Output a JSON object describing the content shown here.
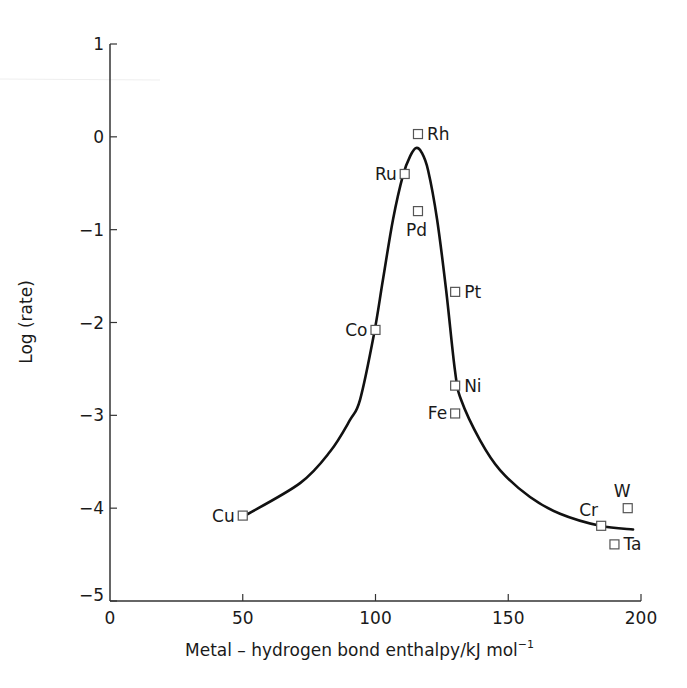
{
  "chart_data": {
    "type": "scatter",
    "title": "",
    "xlabel": "Metal – hydrogen bond enthalpy/kJ mol",
    "xlabel_superscript": "−1",
    "ylabel": "Log (rate)",
    "xlim": [
      0,
      200
    ],
    "ylim": [
      -5,
      1
    ],
    "xticks": [
      0,
      50,
      100,
      150,
      200
    ],
    "xtick_labels": [
      "0",
      "50",
      "100",
      "150",
      "200"
    ],
    "yticks": [
      1,
      0,
      -1,
      -2,
      -3,
      -4,
      -5
    ],
    "ytick_labels": [
      "1",
      "0",
      "−1",
      "−2",
      "−3",
      "−4",
      "−5"
    ],
    "grid": false,
    "legend": null,
    "points": [
      {
        "label": "Rh",
        "x": 116,
        "y": 0.03,
        "label_pos": "right"
      },
      {
        "label": "Ru",
        "x": 111,
        "y": -0.4,
        "label_pos": "left"
      },
      {
        "label": "Pd",
        "x": 116,
        "y": -0.8,
        "label_pos": "below"
      },
      {
        "label": "Pt",
        "x": 130,
        "y": -1.67,
        "label_pos": "right"
      },
      {
        "label": "Co",
        "x": 100,
        "y": -2.08,
        "label_pos": "left"
      },
      {
        "label": "Ni",
        "x": 130,
        "y": -2.68,
        "label_pos": "right"
      },
      {
        "label": "Fe",
        "x": 130,
        "y": -2.98,
        "label_pos": "left"
      },
      {
        "label": "Cu",
        "x": 50,
        "y": -4.08,
        "label_pos": "left"
      },
      {
        "label": "Cr",
        "x": 185,
        "y": -4.19,
        "label_pos": "above-left"
      },
      {
        "label": "W",
        "x": 195,
        "y": -4.0,
        "label_pos": "above"
      },
      {
        "label": "Ta",
        "x": 190,
        "y": -4.39,
        "label_pos": "right"
      }
    ],
    "curve": {
      "name": "volcano fit",
      "x": [
        50.8,
        71.6,
        82.9,
        90.4,
        94.2,
        99.4,
        102.8,
        106.6,
        110.4,
        113.2,
        115.3,
        117.4,
        119.8,
        123.2,
        126.6,
        129.9,
        132.2,
        139.4,
        146.9,
        158.2,
        169.5,
        184.6,
        197
      ],
      "y": [
        -4.08,
        -3.73,
        -3.39,
        -3.05,
        -2.83,
        -2.13,
        -1.54,
        -0.89,
        -0.41,
        -0.2,
        -0.12,
        -0.17,
        -0.36,
        -0.89,
        -1.65,
        -2.51,
        -2.83,
        -3.27,
        -3.59,
        -3.88,
        -4.06,
        -4.19,
        -4.23
      ]
    }
  },
  "colors": {
    "axis": "#333333",
    "curve": "#111111",
    "marker_stroke": "#555555",
    "marker_fill": "#ffffff",
    "text": "#1a1a1a"
  }
}
